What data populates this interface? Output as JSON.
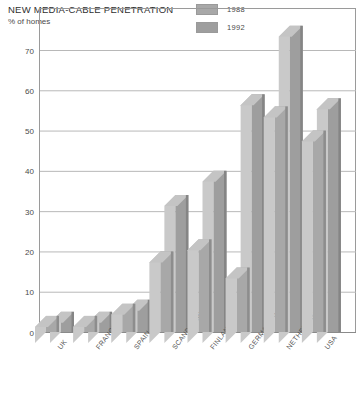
{
  "header": {
    "title": "NEW MEDIA-CABLE PENETRATION",
    "subtitle": "% of homes"
  },
  "legend": {
    "items": [
      {
        "label": "1988",
        "color": "#a8a8a8"
      },
      {
        "label": "1992",
        "color": "#9e9e9e"
      }
    ]
  },
  "colors": {
    "bar_1988": "#a8a8a8",
    "bar_1992": "#9e9e9e",
    "bar_1988_side": "#8d8d8d",
    "bar_1992_side": "#858585",
    "bar_top": "#c4c4c4",
    "gridline": "#b8b8b8",
    "axis": "#8a8a8a",
    "frame": "#9a9a9a"
  },
  "chart_data": {
    "type": "bar",
    "title": "NEW MEDIA-CABLE PENETRATION",
    "subtitle": "% of homes",
    "xlabel": "",
    "ylabel": "% of homes",
    "ylim": [
      0,
      70
    ],
    "yticks": [
      0,
      10,
      20,
      30,
      40,
      50,
      60,
      70
    ],
    "ytick_labels": [
      "0",
      "10",
      "20",
      "30",
      "40",
      "50",
      "60",
      "70"
    ],
    "grid": true,
    "legend_position": "top-right",
    "categories": [
      "UK",
      "FRANCE",
      "SPAIN",
      "SCANDINAVIA",
      "FINLAND",
      "GERMANY W.",
      "NETHERLANDS",
      "USA"
    ],
    "series": [
      {
        "name": "1988",
        "values": [
          4,
          4,
          7,
          20,
          23,
          16,
          56,
          50
        ]
      },
      {
        "name": "1992",
        "values": [
          5,
          5,
          8,
          34,
          40,
          59,
          76,
          58
        ]
      }
    ]
  }
}
